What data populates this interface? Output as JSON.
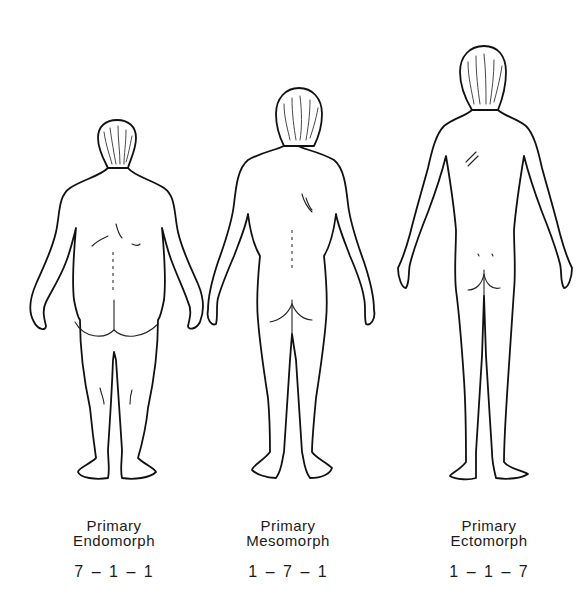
{
  "figures": [
    {
      "id": "endomorph",
      "label_line1": "Primary",
      "label_line2": "Endomorph",
      "rating": "7 – 1 – 1",
      "description": "rear-view line drawing of a heavy, round-bodied figure"
    },
    {
      "id": "mesomorph",
      "label_line1": "Primary",
      "label_line2": "Mesomorph",
      "rating": "1 – 7 – 1",
      "description": "rear-view line drawing of a muscular, broad-shouldered figure"
    },
    {
      "id": "ectomorph",
      "label_line1": "Primary",
      "label_line2": "Ectomorph",
      "rating": "1 – 1 – 7",
      "description": "rear-view line drawing of a tall, thin figure"
    }
  ],
  "colors": {
    "background": "#ffffff",
    "line": "#111111",
    "text": "#1a1a1a"
  }
}
